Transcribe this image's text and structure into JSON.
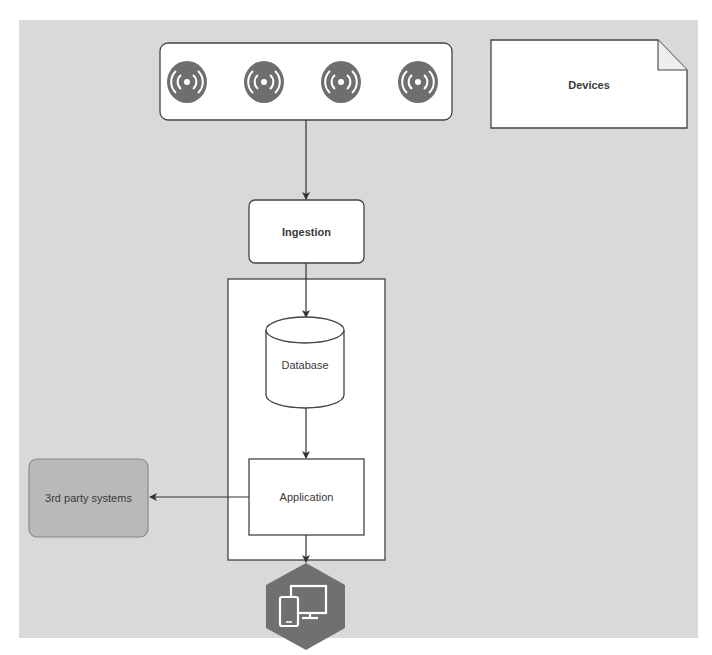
{
  "diagram": {
    "background_color": "#d9d9d9",
    "stroke_color": "#444444",
    "nodes": {
      "devices_group": {
        "label": "",
        "icons": [
          "wireless-sensor-icon",
          "wireless-sensor-icon",
          "wireless-sensor-icon",
          "wireless-sensor-icon"
        ],
        "icon_color": "#6e6e6e"
      },
      "devices_note": {
        "label": "Devices"
      },
      "ingestion": {
        "label": "Ingestion"
      },
      "backend_container": {
        "label": ""
      },
      "database": {
        "label": "Database"
      },
      "application": {
        "label": "Application"
      },
      "third_party": {
        "label": "3rd party systems",
        "fill": "#b9b9b9"
      },
      "clients": {
        "icon": "devices-monitor-phone-icon",
        "fill": "#707070"
      }
    },
    "edges": [
      {
        "from": "devices_group",
        "to": "ingestion"
      },
      {
        "from": "ingestion",
        "to": "database"
      },
      {
        "from": "database",
        "to": "application"
      },
      {
        "from": "application",
        "to": "third_party"
      },
      {
        "from": "application",
        "to": "clients"
      }
    ]
  }
}
